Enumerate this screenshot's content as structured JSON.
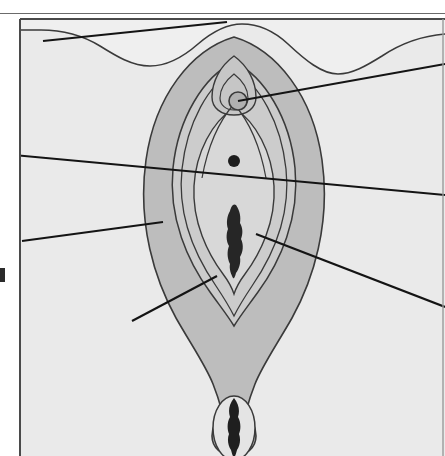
{
  "figure": {
    "kind": "anatomical-line-illustration",
    "orientation": "frontal / lithotomy view, superior at top",
    "caption": "",
    "title": "",
    "visible_text": [],
    "canvas": {
      "width": 445,
      "height": 456
    },
    "rule_top": {
      "y": 13,
      "color": "#6b6b6b",
      "thickness": 1
    },
    "frame": {
      "left": 18,
      "top": 19,
      "right": 444,
      "bottom": 456,
      "color": "#4a4a4a",
      "thickness": 2,
      "note": "illustration panel border; right and bottom edges run off the crop"
    },
    "left_edge_mark": {
      "x": 0,
      "y": 268,
      "width": 5,
      "height": 14,
      "color": "#2b2b2b"
    }
  },
  "palette": {
    "page_white": "#ffffff",
    "panel_background": "#efefef",
    "skin_field": "#eaeaea",
    "labia_majora": "#bdbdbd",
    "labia_minora": "#cccccc",
    "vestibule": "#d8d8d8",
    "clitoral_hood": "#c6c6c6",
    "clitoris_glans": "#b0b0b0",
    "urethral_orifice": "#1d1d1d",
    "vaginal_orifice": "#262626",
    "anus": "#1f1f1f",
    "anus_halo": "#e4e4e4",
    "outline": "#3a3a3a",
    "leader_line": "#141414"
  },
  "structures": [
    {
      "name": "mons-pubis-groin-crease",
      "fill": "page_white",
      "stroke": "outline",
      "note": "wavy superior boundary with white field above"
    },
    {
      "name": "labia-majora",
      "fill": "labia_majora",
      "stroke": "outline"
    },
    {
      "name": "labia-minora",
      "fill": "labia_minora",
      "stroke": "outline"
    },
    {
      "name": "vestibule",
      "fill": "vestibule",
      "stroke": "outline"
    },
    {
      "name": "clitoral-hood-prepuce",
      "fill": "clitoral_hood",
      "stroke": "outline"
    },
    {
      "name": "clitoris-glans",
      "fill": "clitoris_glans",
      "stroke": "outline",
      "center": [
        238,
        101
      ],
      "radius": 9
    },
    {
      "name": "external-urethral-orifice",
      "fill": "urethral_orifice",
      "center": [
        234,
        161
      ],
      "radius": 6
    },
    {
      "name": "vaginal-orifice-introitus",
      "fill": "vaginal_orifice",
      "center": [
        234,
        239
      ]
    },
    {
      "name": "perineum",
      "fill": "labia_majora",
      "stroke": "outline"
    },
    {
      "name": "anus",
      "fill": "anus",
      "center": [
        234,
        428
      ]
    }
  ],
  "leader_lines": [
    {
      "id": "leader-1",
      "label": "",
      "from": [
        14,
        155
      ],
      "to": [
        445,
        195
      ],
      "points_to": "labia-minora / vestibule margin",
      "enters_from": "left",
      "exits": "right"
    },
    {
      "id": "leader-2",
      "label": "",
      "from": [
        22,
        241
      ],
      "to": [
        163,
        222
      ],
      "points_to": "labia-majora",
      "enters_from": "left"
    },
    {
      "id": "leader-3",
      "label": "",
      "from": [
        238,
        101
      ],
      "to": [
        445,
        64
      ],
      "points_to": "clitoris-glans",
      "exits": "right"
    },
    {
      "id": "leader-4",
      "label": "",
      "from": [
        256,
        234
      ],
      "to": [
        445,
        307
      ],
      "points_to": "vaginal-orifice-introitus",
      "exits": "right"
    },
    {
      "id": "leader-5",
      "label": "",
      "from": [
        132,
        321
      ],
      "to": [
        217,
        276
      ],
      "points_to": "vestibule / fossa navicularis",
      "enters_from": "left"
    },
    {
      "id": "leader-6",
      "label": "",
      "from": [
        43,
        41
      ],
      "to": [
        227,
        22
      ],
      "points_to": "mons pubis / groin crease",
      "enters_from": "left"
    }
  ],
  "counts": {
    "leader_lines": 6,
    "shaded_tissue_layers": 4,
    "dark_orifices": 3
  }
}
